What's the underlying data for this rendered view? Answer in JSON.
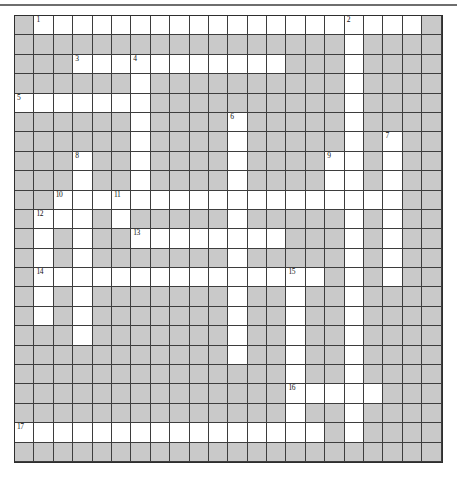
{
  "puzzle": {
    "kind": "crossword-grid",
    "cols": 22,
    "rows": 23,
    "cell_px": 19.4,
    "colors": {
      "blocked": "#c9c9c9",
      "open": "#ffffff",
      "line": "#3d3d3d",
      "outer_border": "#2e2e2e",
      "top_rule": "#6e6e6e",
      "number_text": "#111111"
    },
    "grid": [
      "GWWWWWWWWWWWWWWWWWWWWG",
      "GGGGGGGGGGGGGGGGGWGGGG",
      "GGGWWWWWWWWWWWGGGWGGGG",
      "GGGGGGWGGGGGGGGGGWGGGG",
      "WWWWWWWGGGGGGGGGGWGGGG",
      "GGGGGGWGGGGWGGGGGWGGGG",
      "GGGGGGWGGGGWGGGGGWGWGG",
      "GGGWGGWGGGGWGGGGWWGWGG",
      "GGGWGGWGGGGWGGGGWWGWGG",
      "GGWWWWWWWWWWWWWWWWWWGG",
      "GWWWGWGGGGGWGGGGGWGWGG",
      "GWGWGGWWWWWWWWGGGWGWGG",
      "GWGWGGGGGGGWGGGGGWGWGG",
      "GWWWWWWWWWWWWWWWGWGWGG",
      "GWGWGGGGGGGWGGWGGWGGGG",
      "GWGWGGGGGGGWGGWGGWGGGG",
      "GGGWGGGGGGGWGGWGGWGGGG",
      "GGGGGGGGGGGWGGWGGWGGGG",
      "GGGGGGGGGGGGGGWGGWGGGG",
      "GGGGGGGGGGGGGGWWWWWGGG",
      "GGGGGGGGGGGGGGWGGWGGGG",
      "WWWWWWWWWWWWWWWWGWGGGG",
      "GGGGGGGGGGGGGGGGGGGGGG"
    ],
    "numbers": [
      {
        "row": 0,
        "col": 1,
        "label": "1"
      },
      {
        "row": 0,
        "col": 17,
        "label": "2"
      },
      {
        "row": 2,
        "col": 3,
        "label": "3"
      },
      {
        "row": 2,
        "col": 6,
        "label": "4"
      },
      {
        "row": 4,
        "col": 0,
        "label": "5"
      },
      {
        "row": 5,
        "col": 11,
        "label": "6"
      },
      {
        "row": 6,
        "col": 19,
        "label": "7"
      },
      {
        "row": 7,
        "col": 3,
        "label": "8"
      },
      {
        "row": 7,
        "col": 16,
        "label": "9"
      },
      {
        "row": 9,
        "col": 2,
        "label": "10"
      },
      {
        "row": 9,
        "col": 5,
        "label": "11"
      },
      {
        "row": 10,
        "col": 1,
        "label": "12"
      },
      {
        "row": 11,
        "col": 6,
        "label": "13"
      },
      {
        "row": 13,
        "col": 1,
        "label": "14"
      },
      {
        "row": 13,
        "col": 14,
        "label": "15"
      },
      {
        "row": 19,
        "col": 14,
        "label": "16"
      },
      {
        "row": 21,
        "col": 0,
        "label": "17"
      }
    ]
  }
}
